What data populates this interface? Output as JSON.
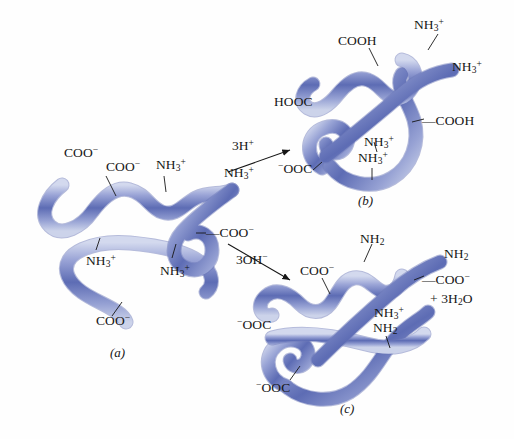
{
  "figure": {
    "type": "biochemistry-diagram",
    "background_color": "#fefefe",
    "ribbon": {
      "core_color": "#5b6bb5",
      "mid_color": "#8d99d2",
      "edge_color": "#cfd5ec",
      "outline_color": "#6b77b8",
      "width_px": 13
    },
    "text_color": "#161616"
  },
  "panels": [
    {
      "id": "a",
      "key": "(a)",
      "key_x": 110,
      "key_y": 348
    },
    {
      "id": "b",
      "key": "(b)",
      "key_x": 358,
      "key_y": 196
    },
    {
      "id": "c",
      "key": "(c)",
      "key_x": 340,
      "key_y": 404
    }
  ],
  "reactions": [
    {
      "id": "up",
      "label_html": "3H<sup>+</sup>",
      "label_x": 238,
      "label_y": 145,
      "arrow": "up-right"
    },
    {
      "id": "down",
      "label_html": "3OH<sup>−</sup>",
      "label_x": 240,
      "label_y": 258,
      "arrow": "down-right"
    }
  ],
  "labels_a": [
    {
      "text": "COO",
      "sup": "−",
      "x": 66,
      "y": 152
    },
    {
      "text": "COO",
      "sup": "−",
      "x": 108,
      "y": 165
    },
    {
      "text": "NH",
      "sub": "3",
      "sup": "+",
      "x": 158,
      "y": 162
    },
    {
      "text": "NH",
      "sub": "3",
      "sup": "+",
      "x": 227,
      "y": 170
    },
    {
      "text": "—COO",
      "sup": "−",
      "x": 210,
      "y": 228
    },
    {
      "text": "NH",
      "sub": "3",
      "sup": "+",
      "x": 90,
      "y": 258
    },
    {
      "text": "NH",
      "sub": "3",
      "sup": "+",
      "x": 163,
      "y": 268
    },
    {
      "text": "COO",
      "sup": "−",
      "x": 99,
      "y": 320
    }
  ],
  "labels_b": [
    {
      "text": "NH",
      "sub": "3",
      "sup": "+",
      "x": 417,
      "y": 22
    },
    {
      "text": "COOH",
      "x": 341,
      "y": 38
    },
    {
      "text": "NH",
      "sub": "3",
      "sup": "+",
      "x": 455,
      "y": 64
    },
    {
      "text": "HOOC",
      "x": 277,
      "y": 99
    },
    {
      "text": "—COOH",
      "x": 425,
      "y": 118
    },
    {
      "text": "NH",
      "sub": "3",
      "sup": "+",
      "x": 367,
      "y": 139
    },
    {
      "text": "NH",
      "sub": "3",
      "sup": "+",
      "x": 361,
      "y": 155
    },
    {
      "text": "−OOC",
      "x": 281,
      "y": 166
    }
  ],
  "labels_c": [
    {
      "text": "NH",
      "sub": "2",
      "x": 363,
      "y": 236
    },
    {
      "text": "NH",
      "sub": "2",
      "x": 447,
      "y": 251
    },
    {
      "text": "COO",
      "sup": "−",
      "x": 303,
      "y": 268
    },
    {
      "text": "—COO",
      "sup": "−",
      "x": 425,
      "y": 277
    },
    {
      "text": "+ 3H",
      "sub": "2",
      "tail": "O",
      "x": 432,
      "y": 296
    },
    {
      "text": "NH",
      "sub": "3",
      "sup": "+",
      "x": 377,
      "y": 310
    },
    {
      "text": "NH",
      "sub": "2",
      "x": 376,
      "y": 325
    },
    {
      "text": "−OOC",
      "x": 240,
      "y": 322
    },
    {
      "text": "−OOC",
      "x": 259,
      "y": 385
    }
  ]
}
